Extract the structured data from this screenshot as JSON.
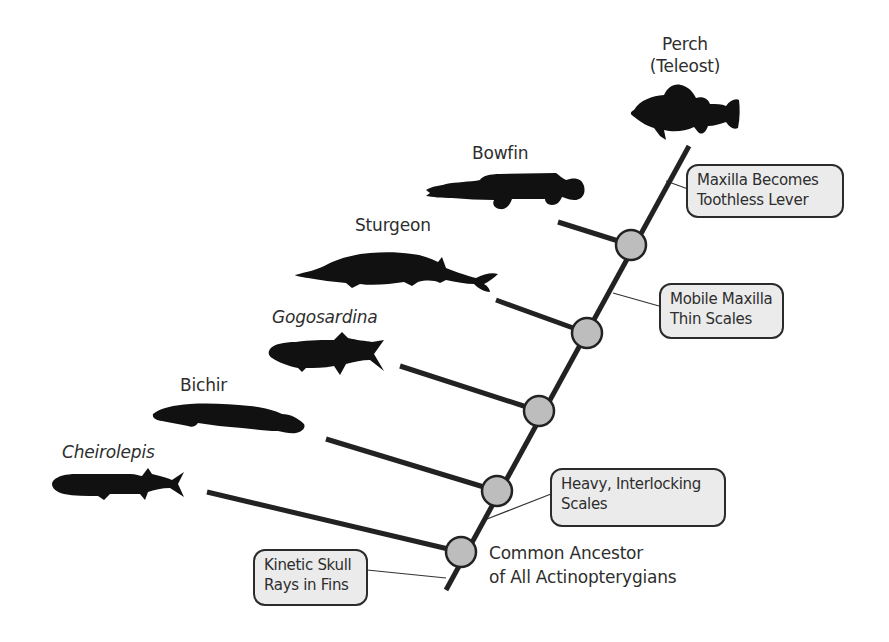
{
  "diagram": {
    "type": "cladogram",
    "colors": {
      "line": "#222222",
      "node_fill": "#bdbdbd",
      "node_stroke": "#222222",
      "box_fill": "#ebebeb",
      "box_stroke": "#2b2b2b",
      "silhouette": "#111111",
      "text": "#2e2e2e"
    },
    "taxa": [
      {
        "id": "perch",
        "name_line1": "Perch",
        "name_line2": "(Teleost)",
        "italic": false
      },
      {
        "id": "bowfin",
        "name": "Bowfin",
        "italic": false
      },
      {
        "id": "sturgeon",
        "name": "Sturgeon",
        "italic": false
      },
      {
        "id": "gogosardina",
        "name": "Gogosardina",
        "italic": true
      },
      {
        "id": "bichir",
        "name": "Bichir",
        "italic": false
      },
      {
        "id": "cheirolepis",
        "name": "Cheirolepis",
        "italic": true
      }
    ],
    "trait_boxes": [
      {
        "id": "toothless-lever",
        "line1": "Maxilla Becomes",
        "line2": "Toothless Lever"
      },
      {
        "id": "mobile-maxilla",
        "line1": "Mobile Maxilla",
        "line2": "Thin Scales"
      },
      {
        "id": "interlocking-scales",
        "line1": "Heavy, Interlocking",
        "line2": "Scales"
      },
      {
        "id": "kinetic-skull",
        "line1": "Kinetic Skull",
        "line2": "Rays in Fins"
      }
    ],
    "root_label": {
      "line1": "Common Ancestor",
      "line2": "of All Actinopterygians"
    },
    "nodes": 5
  }
}
